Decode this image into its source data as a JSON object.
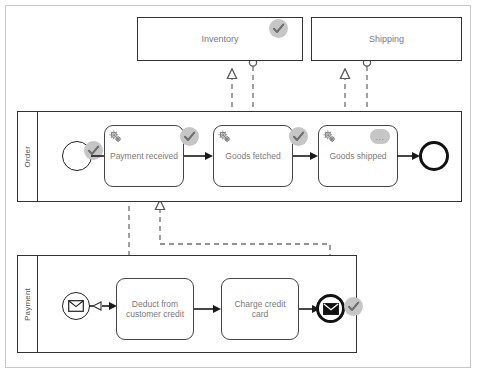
{
  "diagram": {
    "type": "bpmn-collaboration"
  },
  "pools": [
    {
      "id": "inventory",
      "name": "Inventory",
      "collapsed": true,
      "badge": "check",
      "x": 137,
      "y": 17,
      "w": 166,
      "h": 44
    },
    {
      "id": "shipping",
      "name": "Shipping",
      "collapsed": true,
      "badge": null,
      "x": 311,
      "y": 17,
      "w": 151,
      "h": 44
    },
    {
      "id": "order",
      "name": "Order",
      "collapsed": false,
      "badge": null,
      "x": 17,
      "y": 111,
      "w": 445,
      "h": 91
    },
    {
      "id": "payment",
      "name": "Payment",
      "collapsed": false,
      "badge": null,
      "x": 17,
      "y": 255,
      "w": 340,
      "h": 98
    }
  ],
  "order_lane": {
    "label": "Order",
    "start_event": {
      "name": "order-start-event",
      "badge": "check"
    },
    "tasks": [
      {
        "id": "payment-received",
        "label": "Payment received",
        "icon": "service-gear-icon",
        "badge": "check"
      },
      {
        "id": "goods-fetched",
        "label": "Goods fetched",
        "icon": "service-gear-icon",
        "badge": "check"
      },
      {
        "id": "goods-shipped",
        "label": "Goods shipped",
        "icon": "service-gear-icon",
        "badge": "pending"
      }
    ],
    "end_event": {
      "name": "order-end-event",
      "badge": null
    }
  },
  "payment_lane": {
    "label": "Payment",
    "start_event": {
      "name": "message-start-event",
      "icon": "envelope-icon",
      "badge": null
    },
    "tasks": [
      {
        "id": "deduct-from-customer-credit",
        "label": "Deduct from customer credit",
        "icon": null,
        "badge": null
      },
      {
        "id": "charge-credit-card",
        "label": "Charge credit card",
        "icon": null,
        "badge": null
      }
    ],
    "end_event": {
      "name": "message-end-event",
      "icon": "envelope-filled-icon",
      "badge": "check"
    }
  },
  "badges": {
    "check_label": "check-badge",
    "pending_label": "...",
    "check_color": "#c6c6c6",
    "pending_color": "#c6c6c6",
    "check_mark_color": "#6e6e6e"
  },
  "colors": {
    "frame_border": "#c8c8c8",
    "pool_border": "#333333",
    "task_border": "#444444",
    "text": "#7a7a7a",
    "sequence_flow": "#1a1a1a",
    "message_flow": "#6f6f6f"
  }
}
